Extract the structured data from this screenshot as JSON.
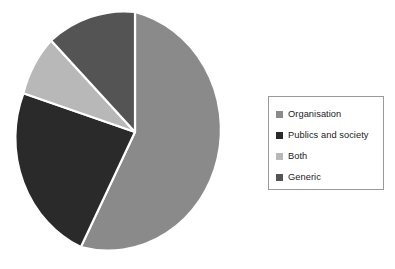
{
  "chart_data": {
    "type": "pie",
    "title": "",
    "categories": [
      "Organisation",
      "Publics and society",
      "Both",
      "Generic"
    ],
    "values": [
      57,
      25,
      9,
      9
    ],
    "units": "percent",
    "colors": [
      "#8a8a8a",
      "#2a2a2a",
      "#b8b8b8",
      "#545454"
    ],
    "start_angle_deg": 0,
    "direction": "clockwise",
    "slice_angles_deg": [
      205.2,
      90.0,
      32.4,
      32.4
    ],
    "labels_shown": false,
    "grid": false,
    "legend_position": "right",
    "legend_border": true
  },
  "legend": {
    "items": [
      {
        "label": "Organisation",
        "color": "#8a8a8a",
        "swatch_name": "legend-swatch-organisation"
      },
      {
        "label": "Publics and society",
        "color": "#2a2a2a",
        "swatch_name": "legend-swatch-publics-and-society"
      },
      {
        "label": "Both",
        "color": "#b8b8b8",
        "swatch_name": "legend-swatch-both"
      },
      {
        "label": "Generic",
        "color": "#545454",
        "swatch_name": "legend-swatch-generic"
      }
    ]
  },
  "pie": {
    "slices": [
      {
        "name": "Organisation",
        "color": "#8a8a8a",
        "path": "M 135 132 L 135 12 A 112 120 0 1 1 80.8 247.1 Z"
      },
      {
        "name": "Publics and society",
        "color": "#2a2a2a",
        "path": "M 135 132 L 80.8 247.1 A 112 120 0 0 1 23.4 93.3 Z"
      },
      {
        "name": "Both",
        "color": "#b8b8b8",
        "path": "M 135 132 L 23.4 93.3 A 112 120 0 0 1 51.1 40.5 Z"
      },
      {
        "name": "Generic",
        "color": "#545454",
        "path": "M 135 132 L 51.1 40.5 A 112 120 0 0 1 135 12 Z"
      }
    ]
  },
  "canvas": {
    "background": "#ffffff"
  }
}
